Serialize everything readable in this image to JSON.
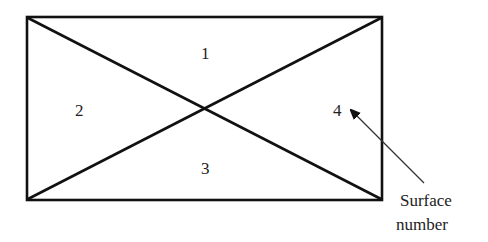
{
  "diagram": {
    "surfaces": [
      {
        "id": "surface-1",
        "label": "1"
      },
      {
        "id": "surface-2",
        "label": "2"
      },
      {
        "id": "surface-3",
        "label": "3"
      },
      {
        "id": "surface-4",
        "label": "4"
      }
    ],
    "annotation": {
      "line1": "Surface",
      "line2": "number"
    },
    "colors": {
      "stroke": "#111111",
      "text": "#222222",
      "arrow": "#333333"
    }
  }
}
